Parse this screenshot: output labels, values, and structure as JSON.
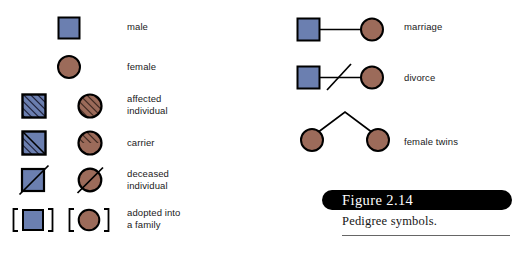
{
  "figure": {
    "number_label": "Figure 2.14",
    "caption": "Pedigree symbols.",
    "background": "#ffffff"
  },
  "colors": {
    "male_fill": "#6b7fb0",
    "female_fill": "#9c6b5a",
    "outline": "#000000",
    "hatch": "#1a1a2e",
    "hatch_female": "#3a241c",
    "caption_pill": "#000000",
    "caption_text": "#ffffff",
    "rule": "#666666"
  },
  "legend": {
    "left_column": [
      {
        "key": "male",
        "label": "male",
        "symbols": [
          "square-plain"
        ],
        "shapes": [
          "square"
        ],
        "fills": [
          "male_fill"
        ]
      },
      {
        "key": "female",
        "label": "female",
        "symbols": [
          "circle-plain"
        ],
        "shapes": [
          "circle"
        ],
        "fills": [
          "female_fill"
        ]
      },
      {
        "key": "affected",
        "label": "affected\nindividual",
        "symbols": [
          "square-hatched",
          "circle-hatched"
        ],
        "shapes": [
          "square",
          "circle"
        ],
        "fills": [
          "male_fill",
          "female_fill"
        ]
      },
      {
        "key": "carrier",
        "label": "carrier",
        "symbols": [
          "square-half-hatched",
          "circle-half-hatched"
        ],
        "shapes": [
          "square",
          "circle"
        ],
        "fills": [
          "male_fill",
          "female_fill"
        ]
      },
      {
        "key": "deceased",
        "label": "deceased\nindividual",
        "symbols": [
          "square-slashed",
          "circle-slashed"
        ],
        "shapes": [
          "square",
          "circle"
        ],
        "fills": [
          "male_fill",
          "female_fill"
        ]
      },
      {
        "key": "adopted",
        "label": "adopted into\na family",
        "symbols": [
          "square-bracketed",
          "circle-bracketed"
        ],
        "shapes": [
          "square",
          "circle"
        ],
        "fills": [
          "male_fill",
          "female_fill"
        ]
      }
    ],
    "right_column": [
      {
        "key": "marriage",
        "label": "marriage",
        "symbols": [
          "square-plain",
          "line-horizontal",
          "circle-plain"
        ]
      },
      {
        "key": "divorce",
        "label": "divorce",
        "symbols": [
          "square-plain",
          "line-horizontal-slashed",
          "circle-plain"
        ]
      },
      {
        "key": "female-twins",
        "label": "female twins",
        "symbols": [
          "circle-plain",
          "twin-fork",
          "circle-plain"
        ]
      }
    ]
  }
}
